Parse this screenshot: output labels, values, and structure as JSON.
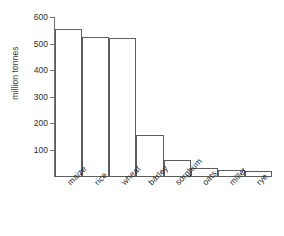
{
  "chart_data": {
    "type": "bar",
    "title": "",
    "xlabel": "",
    "ylabel": "million tonnes",
    "categories": [
      "maize",
      "rice",
      "wheat",
      "barley",
      "sorghum",
      "oats",
      "millet",
      "rye"
    ],
    "values": [
      560,
      530,
      525,
      160,
      63,
      33,
      27,
      22
    ],
    "ylim": [
      0,
      600
    ],
    "yticks": [
      100,
      200,
      300,
      400,
      500,
      600
    ],
    "ytick_labels": [
      "100",
      "200",
      "300",
      "400",
      "500",
      "600"
    ],
    "grid": false,
    "legend": false,
    "bar_fill": "#ffffff",
    "bar_edge": "#5d5d5d",
    "axis_color": "#6f6f6f",
    "background": "#ffffff"
  }
}
